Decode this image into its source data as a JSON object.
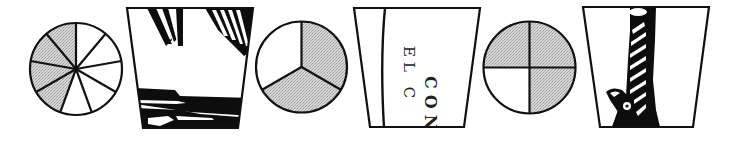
{
  "colors": {
    "ink": "#111111",
    "shade": "#c9c9c9",
    "background": "#ffffff"
  },
  "items": [
    {
      "type": "fraction-circle",
      "segments": 9,
      "shaded": 4,
      "fraction": "4/9"
    },
    {
      "type": "picture-card",
      "content": "illustration fragment (fringe/tassels and dark stripes)"
    },
    {
      "type": "fraction-circle",
      "segments": 3,
      "shaded": 2,
      "fraction": "2/3"
    },
    {
      "type": "picture-card",
      "content": "text fragment",
      "text_line1": "EL C",
      "text_line2": "CON"
    },
    {
      "type": "fraction-circle",
      "segments": 4,
      "shaded": 3,
      "fraction": "3/4"
    },
    {
      "type": "picture-card",
      "content": "illustration fragment (twisted column with bird head)"
    }
  ]
}
